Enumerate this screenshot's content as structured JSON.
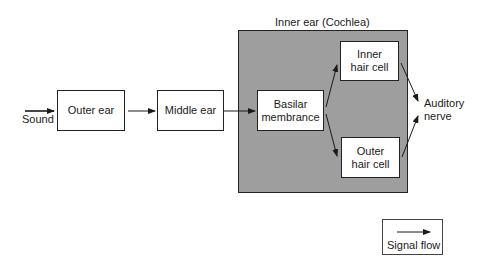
{
  "diagram": {
    "input_label": "Sound",
    "nodes": {
      "outer_ear": "Outer ear",
      "middle_ear": "Middle ear",
      "basilar_line1": "Basilar",
      "basilar_line2": "membrance",
      "inner_hair_line1": "Inner",
      "inner_hair_line2": "hair cell",
      "outer_hair_line1": "Outer",
      "outer_hair_line2": "hair cell",
      "auditory_line1": "Auditory",
      "auditory_line2": "nerve"
    },
    "group": {
      "label": "Inner ear (Cochlea)",
      "fill_color": "#9e9e9e"
    },
    "edges": [
      [
        "Sound",
        "Outer ear"
      ],
      [
        "Outer ear",
        "Middle ear"
      ],
      [
        "Middle ear",
        "Basilar membrance"
      ],
      [
        "Basilar membrance",
        "Inner hair cell"
      ],
      [
        "Basilar membrance",
        "Outer hair cell"
      ],
      [
        "Inner hair cell",
        "Auditory nerve"
      ],
      [
        "Outer hair cell",
        "Auditory nerve"
      ]
    ],
    "legend": {
      "label": "Signal flow",
      "icon": "arrow-right-icon"
    }
  }
}
